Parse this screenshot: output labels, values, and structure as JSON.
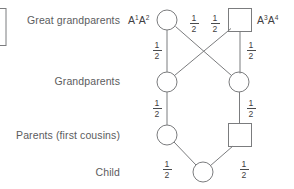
{
  "diagram": {
    "title_alt": "Pedigree of first-cousin mating showing transmission probabilities",
    "stroke_color": "#7b7c7e",
    "text_color": "#5b5c5e",
    "background": "#ffffff",
    "row_labels": [
      {
        "id": "great-grandparents",
        "text": "Great grandparents"
      },
      {
        "id": "grandparents",
        "text": "Grandparents"
      },
      {
        "id": "parents",
        "text": "Parents (first cousins)"
      },
      {
        "id": "child",
        "text": "Child"
      }
    ],
    "allele_labels": [
      {
        "id": "left-allele",
        "a1": "A",
        "s1": "1",
        "a2": "A",
        "s2": "2"
      },
      {
        "id": "right-allele",
        "a1": "A",
        "s1": "3",
        "a2": "A",
        "s2": "4"
      }
    ],
    "edge_labels": [
      {
        "id": "gg-left-cross",
        "num": "1",
        "den": "2"
      },
      {
        "id": "gg-right-cross",
        "num": "1",
        "den": "2"
      },
      {
        "id": "gg-left-down",
        "num": "1",
        "den": "2"
      },
      {
        "id": "gg-right-down",
        "num": "1",
        "den": "2"
      },
      {
        "id": "gp-left-down",
        "num": "1",
        "den": "2"
      },
      {
        "id": "gp-right-down",
        "num": "1",
        "den": "2"
      },
      {
        "id": "parent-left-child",
        "num": "1",
        "den": "2"
      },
      {
        "id": "parent-right-child",
        "num": "1",
        "den": "2"
      }
    ],
    "nodes": [
      {
        "id": "great-grandmother-left",
        "shape": "circle",
        "cx": 167,
        "cy": 20,
        "r": 10
      },
      {
        "id": "great-grandfather-right",
        "shape": "square",
        "cx": 240,
        "cy": 20,
        "size": 23
      },
      {
        "id": "grandparent-left",
        "shape": "circle",
        "cx": 167,
        "cy": 82,
        "r": 10
      },
      {
        "id": "grandparent-right",
        "shape": "circle",
        "cx": 239,
        "cy": 82,
        "r": 10
      },
      {
        "id": "parent-left",
        "shape": "circle",
        "cx": 167,
        "cy": 135,
        "r": 10
      },
      {
        "id": "parent-right",
        "shape": "square",
        "cx": 240,
        "cy": 135,
        "size": 23
      },
      {
        "id": "child-node",
        "shape": "circle",
        "cx": 203,
        "cy": 172,
        "r": 10
      }
    ]
  }
}
